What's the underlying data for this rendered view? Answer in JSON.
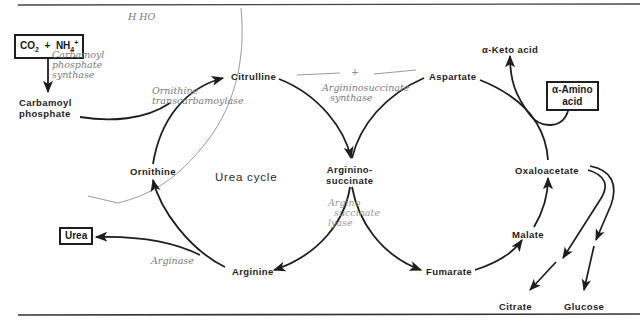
{
  "diagram": {
    "title": "Urea cycle",
    "nodes": {
      "co2_nh4": {
        "label": "CO₂ + NH₄⁺",
        "parts": {
          "co2": "CO",
          "co2_sub": "2",
          "plus": "+",
          "nh": "NH",
          "nh_sup": "+",
          "nh_sub": "4"
        }
      },
      "carbamoyl_phosphate": {
        "line1": "Carbamoyl",
        "line2": "phosphate"
      },
      "citrulline": "Citrulline",
      "aspartate": "Aspartate",
      "argininosuccinate": {
        "line1": "Arginino-",
        "line2": "succinate"
      },
      "ornithine": "Ornithine",
      "arginine": "Arginine",
      "urea": "Urea",
      "fumarate": "Fumarate",
      "malate": "Malate",
      "oxaloacetate": "Oxaloacetate",
      "alpha_keto_acid": "α-Keto acid",
      "alpha_amino_acid": {
        "line1": "α-Amino",
        "line2": "acid"
      },
      "citrate": "Citrate",
      "glucose": "Glucose"
    },
    "handwritten_notes": {
      "top": "H HO",
      "carbamoyl_synthase": {
        "line1": "Carbamoyl",
        "line2": "phosphate",
        "line3": "synthase"
      },
      "ornithine_transcarbamoylase": {
        "line1": "Ornithine",
        "line2": "transcarbamoylase"
      },
      "plus_mark": "+",
      "argininosuccinate_synthase": {
        "line1": "Argininosuccinate",
        "line2": "synthase"
      },
      "argininosuccinate_lyase": {
        "line1": "Argino",
        "line2": "succinate",
        "line3": "lyase"
      },
      "arginase": "Arginase"
    },
    "colors": {
      "ink": "#1e1e1e",
      "pencil": "#7a7a7a",
      "background": "#ffffff"
    }
  }
}
